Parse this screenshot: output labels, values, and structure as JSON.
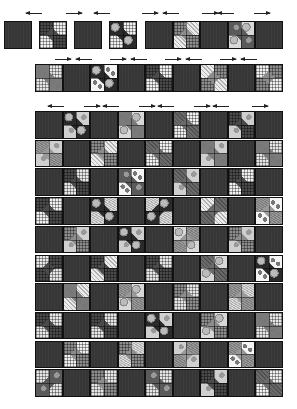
{
  "title": "Quilt assembly diagram",
  "colors": {
    "dark_block": "#363636",
    "outline": "#111111",
    "arrow": "#222222",
    "background": "#ffffff"
  },
  "layout": {
    "block_size": 27.5,
    "row1": {
      "description": "Row 1 partially assembled: four loose blocks and five sewn blocks",
      "loose_blocks": [
        {
          "x": 4,
          "type": "dark"
        },
        {
          "x": 39,
          "type": "pieced",
          "fabric": "plaid-gray"
        },
        {
          "x": 74,
          "type": "dark"
        },
        {
          "x": 109,
          "type": "pieced",
          "fabric": "plaid-dark"
        }
      ],
      "joined_strip": {
        "x": 145,
        "y": 21,
        "blocks": [
          "dark",
          "pieced",
          "dark",
          "pieced",
          "dark"
        ]
      },
      "y": 21,
      "arrows": [
        {
          "x": 26,
          "dir": "left"
        },
        {
          "x": 66,
          "dir": "right"
        },
        {
          "x": 94,
          "dir": "left"
        },
        {
          "x": 142,
          "dir": "right"
        },
        {
          "x": 163,
          "dir": "left"
        },
        {
          "x": 202,
          "dir": "right"
        },
        {
          "x": 218,
          "dir": "left"
        },
        {
          "x": 254,
          "dir": "right"
        }
      ],
      "arrow_y": 13
    },
    "row2": {
      "description": "Row 2 sewn strip of nine blocks",
      "x": 35,
      "y": 64,
      "blocks": [
        "pieced",
        "dark",
        "pieced",
        "dark",
        "pieced",
        "dark",
        "pieced",
        "dark",
        "pieced"
      ],
      "arrows": [
        {
          "x": 55,
          "dir": "right"
        },
        {
          "x": 76,
          "dir": "left"
        },
        {
          "x": 110,
          "dir": "right"
        },
        {
          "x": 131,
          "dir": "left"
        },
        {
          "x": 165,
          "dir": "right"
        },
        {
          "x": 186,
          "dir": "left"
        },
        {
          "x": 220,
          "dir": "right"
        },
        {
          "x": 241,
          "dir": "left"
        }
      ],
      "arrow_y": 59
    },
    "main_quilt": {
      "description": "Assembled quilt top: 9 columns × 10 rows, alternating dark and pieced blocks",
      "x": 35,
      "y": 111,
      "cols": 9,
      "rows": 10,
      "first_row_starts_with": "dark",
      "arrows": [
        {
          "x": 48,
          "dir": "left"
        },
        {
          "x": 84,
          "dir": "right"
        },
        {
          "x": 103,
          "dir": "left"
        },
        {
          "x": 139,
          "dir": "right"
        },
        {
          "x": 158,
          "dir": "left"
        },
        {
          "x": 194,
          "dir": "right"
        },
        {
          "x": 213,
          "dir": "left"
        },
        {
          "x": 252,
          "dir": "right"
        }
      ],
      "arrow_y": 106
    }
  },
  "fabrics": [
    {
      "name": "plaid-gray",
      "base": "#8c8c8c",
      "light": "#e6e6e6",
      "pattern": "plaid"
    },
    {
      "name": "floral-dark",
      "base": "#2a2a2a",
      "light": "#d8d8d8",
      "pattern": "floral"
    },
    {
      "name": "paisley",
      "base": "#5a5a5a",
      "light": "#cfcfcf",
      "pattern": "paisley"
    },
    {
      "name": "plaid-dark",
      "base": "#4a4a4a",
      "light": "#f0f0f0",
      "pattern": "plaid"
    },
    {
      "name": "dots",
      "base": "#7a7a7a",
      "light": "#f4f4f4",
      "pattern": "dots"
    },
    {
      "name": "speckle",
      "base": "#9a9a9a",
      "light": "#dcdcdc",
      "pattern": "speckle"
    },
    {
      "name": "checks",
      "base": "#6a6a6a",
      "light": "#ececec",
      "pattern": "checks"
    }
  ]
}
